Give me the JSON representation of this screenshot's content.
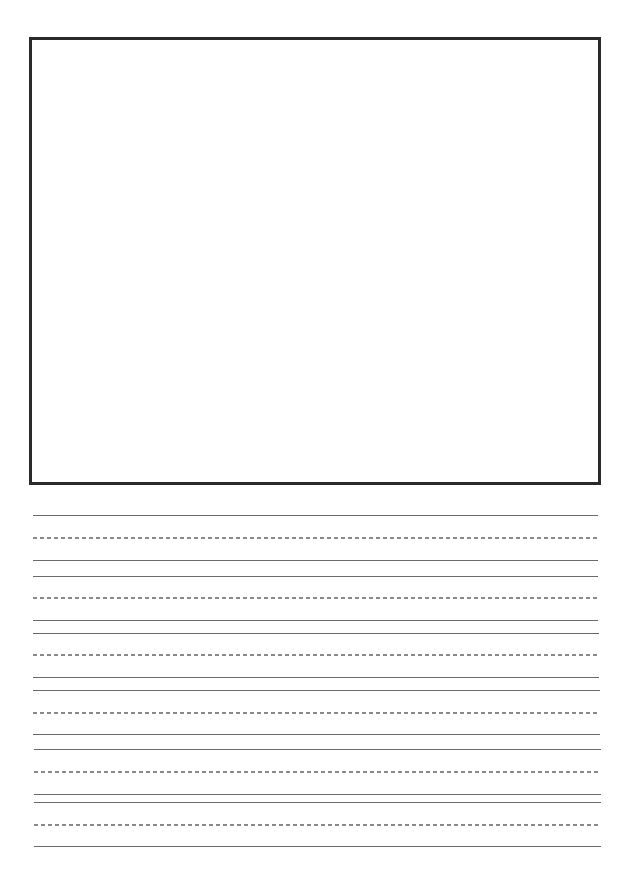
{
  "page": {
    "type": "handwriting-practice-sheet",
    "background_color": "#ffffff"
  },
  "drawing_box": {
    "border_color": "#2a2a2a",
    "left": 29,
    "top": 37,
    "right": 601,
    "bottom": 485
  },
  "writing_lines": {
    "line_color": "#6a6a6a",
    "dash_color": "#888888",
    "rows": [
      {
        "top": 516,
        "mid": 538,
        "base": 561,
        "left": 33,
        "right": 598
      },
      {
        "top": 577,
        "mid": 598,
        "base": 621,
        "left": 33,
        "right": 598
      },
      {
        "top": 634,
        "mid": 655,
        "base": 678,
        "left": 33,
        "right": 599
      },
      {
        "top": 691,
        "mid": 713,
        "base": 735,
        "left": 33,
        "right": 600
      },
      {
        "top": 750,
        "mid": 772,
        "base": 795,
        "left": 34,
        "right": 601
      },
      {
        "top": 803,
        "mid": 825,
        "base": 847,
        "left": 34,
        "right": 601
      }
    ]
  }
}
